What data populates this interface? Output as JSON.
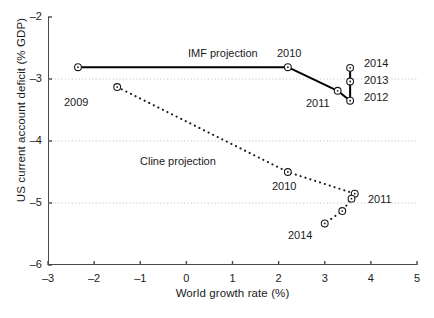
{
  "chart_data": {
    "type": "line",
    "title": "",
    "xlabel": "World growth rate (%)",
    "ylabel": "US current account deficit (% GDP)",
    "xlim": [
      -3,
      5
    ],
    "ylim": [
      -6,
      -2
    ],
    "xticks": [
      "-3",
      "-2",
      "-1",
      "0",
      "1",
      "2",
      "3",
      "4",
      "5"
    ],
    "yticks": [
      "-2",
      "-3",
      "-4",
      "-5",
      "-6"
    ],
    "xtick_values": [
      -3,
      -2,
      -1,
      0,
      1,
      2,
      3,
      4,
      5
    ],
    "ytick_values": [
      -2,
      -3,
      -4,
      -5,
      -6
    ],
    "grid": "horizontal-dotted",
    "legend": "inline-annotations",
    "series": [
      {
        "name": "IMF projection",
        "style": "solid",
        "marker": "open-circle",
        "points": [
          {
            "label": "2009",
            "x": -2.35,
            "y": -2.81
          },
          {
            "label": "2010",
            "x": 2.2,
            "y": -2.81
          },
          {
            "label": "2011",
            "x": 3.28,
            "y": -3.19
          },
          {
            "label": "2012",
            "x": 3.55,
            "y": -3.35
          },
          {
            "label": "2013",
            "x": 3.55,
            "y": -3.04
          },
          {
            "label": "2014",
            "x": 3.55,
            "y": -2.82
          }
        ]
      },
      {
        "name": "Cline projection",
        "style": "dotted",
        "marker": "open-circle",
        "points": [
          {
            "label": "2009",
            "x": -1.5,
            "y": -3.13
          },
          {
            "label": "2010",
            "x": 2.2,
            "y": -4.5
          },
          {
            "label": "2011",
            "x": 3.65,
            "y": -4.85
          },
          {
            "label": "2012",
            "x": 3.58,
            "y": -4.93
          },
          {
            "label": "2013",
            "x": 3.38,
            "y": -5.13
          },
          {
            "label": "2014",
            "x": 3.0,
            "y": -5.33
          }
        ]
      }
    ],
    "annotations": [
      {
        "text": "IMF projection",
        "x": 188,
        "y": 47
      },
      {
        "text": "2010",
        "x": 277,
        "y": 47,
        "series": "IMF projection"
      },
      {
        "text": "2009",
        "x": 64,
        "y": 96,
        "series": "IMF projection"
      },
      {
        "text": "2014",
        "x": 364,
        "y": 57,
        "series": "IMF projection"
      },
      {
        "text": "2013",
        "x": 364,
        "y": 74,
        "series": "IMF projection"
      },
      {
        "text": "2012",
        "x": 364,
        "y": 91,
        "series": "IMF projection"
      },
      {
        "text": "2011",
        "x": 306,
        "y": 97,
        "series": "IMF projection"
      },
      {
        "text": "Cline projection",
        "x": 140,
        "y": 155
      },
      {
        "text": "2010",
        "x": 272,
        "y": 180,
        "series": "Cline projection"
      },
      {
        "text": "2011",
        "x": 368,
        "y": 193,
        "series": "Cline projection"
      },
      {
        "text": "2014",
        "x": 288,
        "y": 229,
        "series": "Cline projection"
      }
    ],
    "colors": {
      "axis": "#4a4a4a",
      "grid": "#bdbdbd",
      "imf_line": "#000000",
      "cline_line": "#1a1a1a",
      "marker_edge": "#1a1a1a",
      "marker_fill": "#ffffff",
      "text": "#1a1a1a",
      "background": "#ffffff"
    }
  }
}
